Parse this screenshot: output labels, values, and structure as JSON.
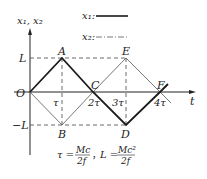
{
  "axes": {
    "y_label": "x₁, x₂",
    "x_label": "t",
    "origin": "O",
    "y_ticks": [
      "L",
      "−L"
    ],
    "x_ticks": [
      "τ",
      "2τ",
      "3τ",
      "4τ"
    ]
  },
  "legend": {
    "x1": "x₁:",
    "x2": "x₂:"
  },
  "points": {
    "A": "A",
    "B": "B",
    "C": "C",
    "D": "D",
    "E": "E",
    "F": "F"
  },
  "formula": {
    "tau_lhs": "τ =",
    "tau_num": "Mc",
    "tau_den": "2f",
    "sep": "，",
    "L_lhs": "L =",
    "L_num": "Mc²",
    "L_den": "2f"
  },
  "colors": {
    "x1": "#1a1a1a",
    "x2": "#555555",
    "guide": "#444444"
  }
}
